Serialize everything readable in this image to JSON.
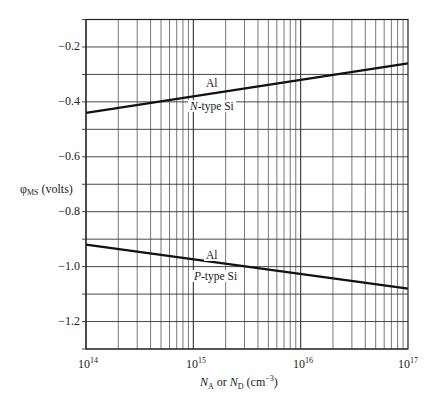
{
  "chart_data": {
    "type": "line",
    "title": "",
    "xlabel": "N_A or N_D (cm^-3)",
    "ylabel": "φ_MS (volts)",
    "xscale": "log",
    "xlim": [
      100000000000000.0,
      1e+17
    ],
    "ylim": [
      -1.3,
      -0.1
    ],
    "x_tick_labels": [
      "10^14",
      "10^15",
      "10^16",
      "10^17"
    ],
    "y_tick_labels": [
      "-0.2",
      "-0.4",
      "-0.6",
      "-0.8",
      "-1.0",
      "-1.2"
    ],
    "y_ticks": [
      -0.2,
      -0.4,
      -0.6,
      -0.8,
      -1.0,
      -1.2
    ],
    "grid": true,
    "series": [
      {
        "name": "Al / N-type Si",
        "label_top": "Al",
        "label_bottom": "N-type Si",
        "x": [
          100000000000000.0,
          1e+17
        ],
        "values": [
          -0.44,
          -0.26
        ]
      },
      {
        "name": "Al / P-type Si",
        "label_top": "Al",
        "label_bottom": "P-type Si",
        "x": [
          100000000000000.0,
          1e+17
        ],
        "values": [
          -0.92,
          -1.08
        ]
      }
    ],
    "annotations": [
      "Al",
      "N-type Si",
      "Al",
      "P-type Si"
    ]
  },
  "axis": {
    "ylabel_main": "φ",
    "ylabel_sub": "MS",
    "ylabel_unit": " (volts)",
    "xlabel_n1": "N",
    "xlabel_sub1": "A",
    "xlabel_or": " or ",
    "xlabel_n2": "N",
    "xlabel_sub2": "D",
    "xlabel_unit_open": " (cm",
    "xlabel_unit_sup": "−3",
    "xlabel_unit_close": ")",
    "xticks": [
      {
        "base": "10",
        "exp": "14"
      },
      {
        "base": "10",
        "exp": "15"
      },
      {
        "base": "10",
        "exp": "16"
      },
      {
        "base": "10",
        "exp": "17"
      }
    ],
    "yticks": [
      "−0.2",
      "−0.4",
      "−0.6",
      "−0.8",
      "−1.0",
      "−1.2"
    ]
  },
  "labels": {
    "n_metal": "Al",
    "n_type_letter": "N",
    "n_type_rest": "-type Si",
    "p_metal": "Al",
    "p_type_letter": "P",
    "p_type_rest": "-type Si"
  }
}
